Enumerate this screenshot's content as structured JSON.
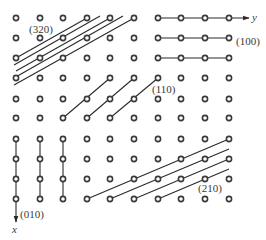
{
  "diagram": {
    "type": "crystal-lattice-planes",
    "grid": {
      "columns_x": [
        16,
        40,
        63,
        87,
        110,
        134,
        158,
        181,
        205,
        229
      ],
      "rows_y": [
        18,
        38,
        58,
        78,
        99,
        118,
        139,
        159,
        179,
        199
      ],
      "dot_radius": 2.6,
      "dot_stroke": "#3a3a3a"
    },
    "axes": {
      "y_label": "y",
      "x_label": "x"
    },
    "plane_labels": {
      "p320": "(320)",
      "p100": "(100)",
      "p110": "(110)",
      "p210": "(210)",
      "p010": "(010)"
    },
    "line_color": "#2a2a2a"
  }
}
